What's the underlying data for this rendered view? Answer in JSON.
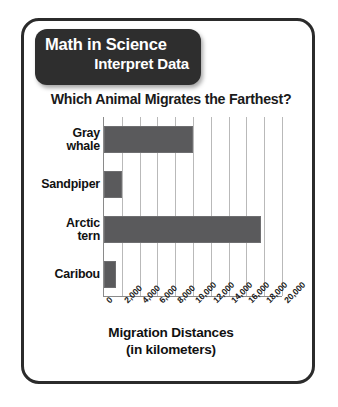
{
  "header": {
    "line1": "Math in Science",
    "line2": "Interpret Data",
    "background_color": "#2e2e2e",
    "text_color": "#ffffff"
  },
  "card": {
    "border_color": "#2b2b2b",
    "background_color": "#ffffff"
  },
  "axis_caption": {
    "line1": "Migration Distances",
    "line2": "(in kilometers)"
  },
  "chart_data": {
    "type": "bar",
    "orientation": "horizontal",
    "title": "Which Animal Migrates the Farthest?",
    "xlabel": "Migration Distances (in kilometers)",
    "ylabel": "",
    "categories": [
      "Gray whale",
      "Sandpiper",
      "Arctic tern",
      "Caribou"
    ],
    "values": [
      10000,
      2000,
      17600,
      1300
    ],
    "xlim": [
      0,
      20000
    ],
    "xticks": [
      0,
      2000,
      4000,
      6000,
      8000,
      10000,
      12000,
      14000,
      16000,
      18000,
      20000
    ],
    "xticklabels": [
      "0",
      "2,000",
      "4,000",
      "6,000",
      "8,000",
      "10,000",
      "12,000",
      "14,000",
      "16,000",
      "18,000",
      "20,000"
    ],
    "tick_label_rotation": -45,
    "grid": "vertical",
    "grid_color": "#b9b9b9",
    "legend": "none",
    "bar_color": "#5a5a5c",
    "axis_color": "#8a8a8a"
  }
}
